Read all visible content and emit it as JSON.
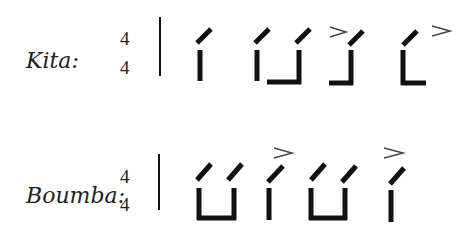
{
  "rows": [
    {
      "label": "Kita:",
      "time_signature": {
        "numerator": "4",
        "denominator": "4"
      },
      "glyphs": [
        {
          "type": "open-single",
          "accent": false
        },
        {
          "type": "open-pair-joined",
          "accent": false
        },
        {
          "type": "open-right-foot",
          "accent": true
        },
        {
          "type": "open-left-foot",
          "accent": true
        }
      ]
    },
    {
      "label": "Boumba:",
      "time_signature": {
        "numerator": "4",
        "denominator": "4"
      },
      "glyphs": [
        {
          "type": "open-pair-joined",
          "accent": false
        },
        {
          "type": "open-single",
          "accent": true
        },
        {
          "type": "open-pair-joined",
          "accent": false
        },
        {
          "type": "open-single",
          "accent": true
        }
      ]
    }
  ],
  "accent_symbol": ">",
  "colors": {
    "ink": "#111111",
    "text": "#222222",
    "accent": "#444444"
  }
}
